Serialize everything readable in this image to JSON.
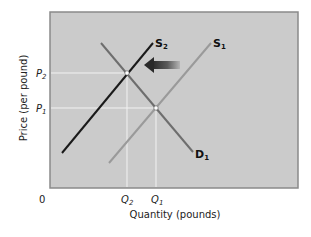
{
  "figure": {
    "type": "supply-demand diagram",
    "y_axis_label": "Price (per pound)",
    "x_axis_label": "Quantity (pounds)",
    "origin_label": "0",
    "price_ticks": [
      {
        "main": "P",
        "sub": "2"
      },
      {
        "main": "P",
        "sub": "1"
      }
    ],
    "quantity_ticks": [
      {
        "main": "Q",
        "sub": "2"
      },
      {
        "main": "Q",
        "sub": "1"
      }
    ],
    "curves": [
      {
        "name": "S2",
        "main": "S",
        "sub": "2",
        "role": "new supply (shifted left)",
        "color": "#1a1a1a"
      },
      {
        "name": "S1",
        "main": "S",
        "sub": "1",
        "role": "original supply",
        "color": "#9a9a9a"
      },
      {
        "name": "D1",
        "main": "D",
        "sub": "1",
        "role": "demand",
        "color": "#6e6e6e"
      }
    ],
    "shift_arrow": {
      "direction": "left",
      "meaning": "supply decreases from S1 to S2"
    },
    "equilibria": [
      {
        "label": "new equilibrium",
        "price": "P2",
        "quantity": "Q2"
      },
      {
        "label": "original equilibrium",
        "price": "P1",
        "quantity": "Q1"
      }
    ],
    "colors": {
      "plot_background": "#cbcbcb",
      "frame": "#8a8a8a",
      "guide_lines": "#f2f2f2"
    }
  }
}
